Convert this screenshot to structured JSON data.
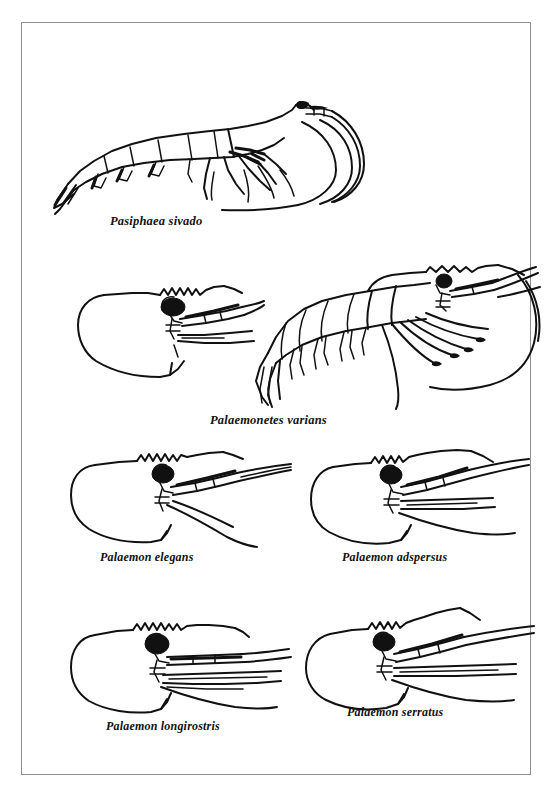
{
  "plate": {
    "background_color": "#ffffff",
    "border_color": "#8e8e8e",
    "ink_color": "#111111",
    "figures": [
      {
        "id": "pasiphaea-sivado",
        "label": "Pasiphaea sivado",
        "view": "whole-animal-lateral",
        "orientation": "head-right-tail-left",
        "features": "slender elongate body, segmented abdomen, long sweeping antennae curving downward, pointed telson with uropods, dark eye"
      },
      {
        "id": "palaemonetes-varians",
        "label": "Palaemonetes varians",
        "view": "pair-carapace-detail-and-whole-animal",
        "orientation": "head-right-tail-left",
        "features": "left: enlarged carapace and rostrum detail with serrated dorsal margin; right: whole animal with segmented abdomen, pereiopods and long antennae"
      },
      {
        "id": "palaemon-elegans",
        "label": "Palaemon elegans",
        "view": "carapace-and-rostrum-detail",
        "orientation": "rostrum-right",
        "features": "rounded carapace, dorsally serrated rostrum with about 8 teeth, large dark round eye, antennal scale and flagella"
      },
      {
        "id": "palaemon-adspersus",
        "label": "Palaemon adspersus",
        "view": "carapace-and-rostrum-detail",
        "orientation": "rostrum-right",
        "features": "rounded carapace, upturned serrated rostrum, large dark eye, paired antennal flagella"
      },
      {
        "id": "palaemon-longirostris",
        "label": "Palaemon longirostris",
        "view": "carapace-and-rostrum-detail",
        "orientation": "rostrum-right",
        "features": "rounded carapace, conspicuously long straight rostrum with many dorsal teeth, dark eye, long antennae"
      },
      {
        "id": "palaemon-serratus",
        "label": "Palaemon serratus",
        "view": "carapace-and-rostrum-detail",
        "orientation": "rostrum-right",
        "features": "rounded carapace, strongly upcurved serrated rostrum, dark eye, long slender antennal flagella"
      }
    ]
  }
}
